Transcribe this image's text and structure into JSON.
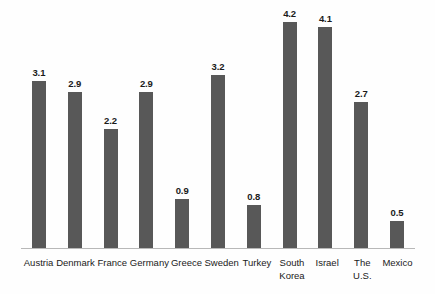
{
  "chart_data": {
    "type": "bar",
    "title": "",
    "subtitle": "",
    "xlabel": "",
    "ylabel": "",
    "ylim": [
      0,
      4.6
    ],
    "grid": false,
    "legend": null,
    "bar_color": "#585858",
    "background_color": "#fefefe",
    "axis_color": "#b8b8b8",
    "value_labels_shown": true,
    "categories": [
      "Austria",
      "Denmark",
      "France",
      "Germany",
      "Greece",
      "Sweden",
      "Turkey",
      "South Korea",
      "Israel",
      "The U.S.",
      "Mexico"
    ],
    "values": [
      3.1,
      2.9,
      2.2,
      2.9,
      0.9,
      3.2,
      0.8,
      4.2,
      4.1,
      2.7,
      0.5
    ],
    "value_labels": [
      "3.1",
      "2.9",
      "2.2",
      "2.9",
      "0.9",
      "3.2",
      "0.8",
      "4.2",
      "4.1",
      "2.7",
      "0.5"
    ]
  }
}
